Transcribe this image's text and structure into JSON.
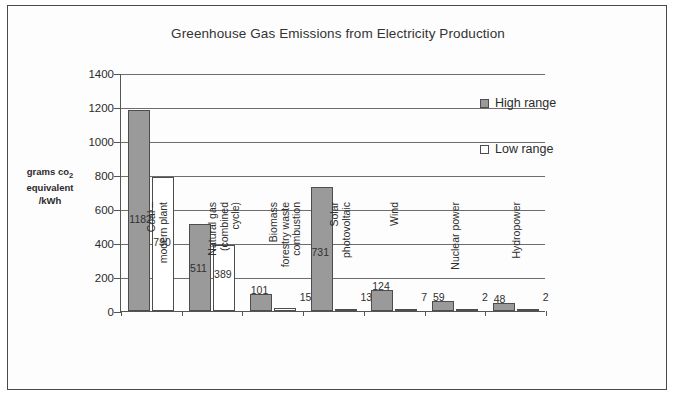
{
  "chart_data": {
    "type": "bar",
    "title": "Greenhouse Gas Emissions from Electricity Production",
    "xlabel": "",
    "ylabel": "grams co2 equivalent /kWh",
    "ylabel_lines": [
      "grams co",
      "equivalent",
      "/kWh"
    ],
    "ylabel_subscript": "2",
    "ylim": [
      0,
      1400
    ],
    "ytick_step": 200,
    "yticks": [
      0,
      200,
      400,
      600,
      800,
      1000,
      1200,
      1400
    ],
    "grid": true,
    "legend_position": "inside-top-right",
    "categories": [
      "Coal –\nmodern plant",
      "Natural gas\n(combined\ncycle)",
      "Biomass\nforestry waste\ncombustion",
      "Solar\nphotovoltaic",
      "Wind",
      "Nuclear power",
      "Hydropower"
    ],
    "series": [
      {
        "name": "High range",
        "color": "#9a9a9a",
        "values": [
          1182,
          511,
          101,
          731,
          124,
          59,
          48
        ]
      },
      {
        "name": "Low range",
        "color": "#ffffff",
        "values": [
          790,
          389,
          15,
          13,
          7,
          2,
          2
        ]
      }
    ]
  },
  "legend": {
    "items": [
      {
        "label": "High range",
        "swatch": "high"
      },
      {
        "label": "Low range",
        "swatch": "low"
      }
    ]
  }
}
